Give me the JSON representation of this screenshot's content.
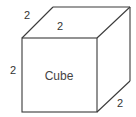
{
  "diagram": {
    "shape": "cube",
    "label": "Cube",
    "dimensions": {
      "top_left_edge": "2",
      "top_depth": "2",
      "left_height": "2",
      "bottom_right_depth": "2"
    },
    "colors": {
      "stroke": "#3a3a3a",
      "text": "#333333",
      "background": "#ffffff"
    }
  }
}
